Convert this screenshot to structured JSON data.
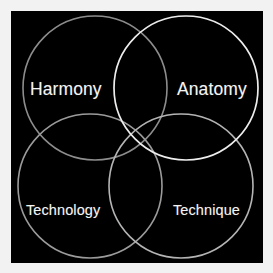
{
  "figure": {
    "type": "four-set-venn-diagram",
    "background_color": "#f2f2f2",
    "panel_color": "#000000",
    "label_color": "#f4f4f4"
  },
  "sets": [
    {
      "id": "harmony",
      "label": "Harmony",
      "position": "top-left",
      "stroke_color": "#8d8d8d",
      "cx": 84,
      "cy": 77,
      "r": 72
    },
    {
      "id": "anatomy",
      "label": "Anatomy",
      "position": "top-right",
      "stroke_color": "#ededed",
      "cx": 175,
      "cy": 77,
      "r": 72
    },
    {
      "id": "technology",
      "label": "Technology",
      "position": "bottom-left",
      "stroke_color": "#9b9b9b",
      "cx": 79,
      "cy": 175,
      "r": 72
    },
    {
      "id": "technique",
      "label": "Technique",
      "position": "bottom-right",
      "stroke_color": "#b4b4b4",
      "cx": 170,
      "cy": 175,
      "r": 72
    }
  ]
}
